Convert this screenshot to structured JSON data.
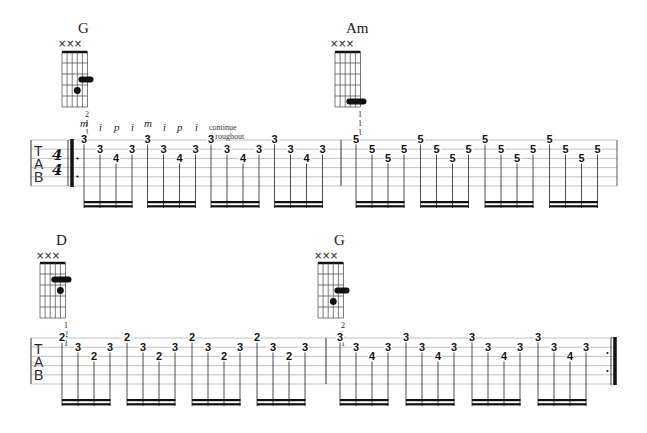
{
  "pattern": {
    "fingers": [
      "m",
      "i",
      "p",
      "i",
      "m",
      "i",
      "p",
      "i"
    ],
    "note": "continue throughout"
  },
  "time_signature": {
    "top": "4",
    "bottom": "4"
  },
  "tab_clef": [
    "T",
    "A",
    "B"
  ],
  "chords": [
    {
      "name": "G",
      "muted": "×××",
      "fingering": "2 1 1",
      "x": 62,
      "y": 22
    },
    {
      "name": "Am",
      "muted": "×××",
      "fingering": "1 1 1",
      "x": 335,
      "y": 22
    },
    {
      "name": "D",
      "muted": "×××",
      "fingering": "1 2 1",
      "x": 40,
      "y": 262
    },
    {
      "name": "G",
      "muted": "×××",
      "fingering": "2 1 1",
      "x": 318,
      "y": 262
    }
  ],
  "systems": [
    {
      "measures": [
        {
          "chord": "G",
          "groups": [
            [
              "3",
              "3",
              "4",
              "3"
            ],
            [
              "3",
              "3",
              "4",
              "3"
            ],
            [
              "3",
              "3",
              "4",
              "3"
            ],
            [
              "3",
              "3",
              "4",
              "3"
            ]
          ],
          "strings": [
            1,
            2,
            3,
            2
          ]
        },
        {
          "chord": "Am",
          "groups": [
            [
              "5",
              "5",
              "5",
              "5"
            ],
            [
              "5",
              "5",
              "5",
              "5"
            ],
            [
              "5",
              "5",
              "5",
              "5"
            ],
            [
              "5",
              "5",
              "5",
              "5"
            ]
          ],
          "strings": [
            1,
            2,
            3,
            2
          ]
        }
      ]
    },
    {
      "measures": [
        {
          "chord": "D",
          "groups": [
            [
              "2",
              "3",
              "2",
              "3"
            ],
            [
              "2",
              "3",
              "2",
              "3"
            ],
            [
              "2",
              "3",
              "2",
              "3"
            ],
            [
              "2",
              "3",
              "2",
              "3"
            ]
          ],
          "strings": [
            1,
            2,
            3,
            2
          ]
        },
        {
          "chord": "G",
          "groups": [
            [
              "3",
              "3",
              "4",
              "3"
            ],
            [
              "3",
              "3",
              "4",
              "3"
            ],
            [
              "3",
              "3",
              "4",
              "3"
            ],
            [
              "3",
              "3",
              "4",
              "3"
            ]
          ],
          "strings": [
            1,
            2,
            3,
            2
          ]
        }
      ]
    }
  ]
}
